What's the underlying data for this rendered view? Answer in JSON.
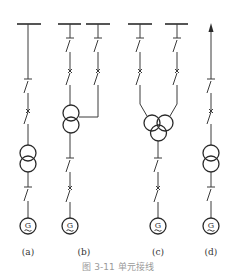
{
  "figure": {
    "caption": "图 3-11  单元接线",
    "subfigures": [
      {
        "id": "a",
        "label": "(a)",
        "description": "Generator-double-winding transformer unit, single busbar connection",
        "generator_label": "G"
      },
      {
        "id": "b",
        "label": "(b)",
        "description": "Generator-double-winding transformer unit with tap to second busbar",
        "generator_label": "G"
      },
      {
        "id": "c",
        "label": "(c)",
        "description": "Generator-three-winding transformer unit connected to two busbars",
        "generator_label": "G"
      },
      {
        "id": "d",
        "label": "(d)",
        "description": "Generator-transformer-line unit (outgoing arrow)",
        "generator_label": "G"
      }
    ]
  },
  "colors": {
    "line": "#3a3a3a",
    "caption": "#9a9a9a",
    "background": "#ffffff"
  }
}
